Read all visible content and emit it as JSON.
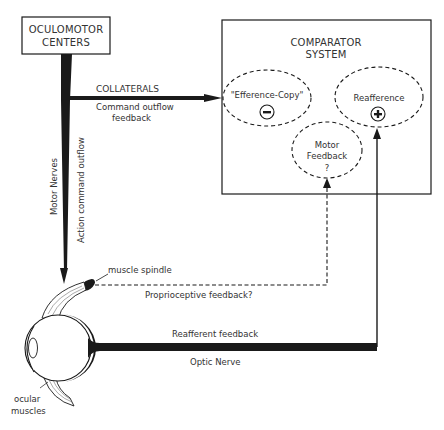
{
  "oculomotor": {
    "line1": "OCULOMOTOR",
    "line2": "CENTERS"
  },
  "comparator": {
    "line1": "COMPARATOR",
    "line2": "SYSTEM",
    "efference_copy": {
      "label": "\"Efference-Copy\"",
      "sign": "−",
      "sign_icon": "minus-circle-icon"
    },
    "reafference": {
      "label": "Reafference",
      "sign": "+",
      "sign_icon": "plus-circle-icon"
    },
    "motor_feedback": {
      "line1": "Motor",
      "line2": "Feedback",
      "line3": "?"
    }
  },
  "collaterals": {
    "title": "COLLATERALS",
    "line1": "Command outflow",
    "line2": "feedback"
  },
  "motor_nerves": {
    "label": "Motor Nerves"
  },
  "action_command": {
    "label": "Action command outflow"
  },
  "muscle_spindle": {
    "label": "muscle spindle"
  },
  "proprioceptive": {
    "label": "Proprioceptive feedback?"
  },
  "reafferent": {
    "label": "Reafferent feedback"
  },
  "optic_nerve": {
    "label": "Optic Nerve"
  },
  "ocular_muscles": {
    "line1": "ocular",
    "line2": "muscles"
  },
  "colors": {
    "ink": "#1a1a1a",
    "text": "#333333",
    "background": "#ffffff"
  }
}
